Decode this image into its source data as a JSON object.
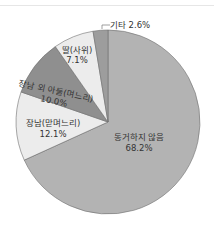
{
  "chart_data": {
    "type": "pie",
    "title": "",
    "start_angle": "12 o'clock",
    "direction": "clockwise",
    "slices": [
      {
        "label": "동거하지 않음",
        "value": 68.2,
        "color": "#b3b3b3"
      },
      {
        "label": "장남(맏며느리)",
        "value": 12.1,
        "color": "#ececec"
      },
      {
        "label": "장남 외 아들(며느리)",
        "value": 10.0,
        "color": "#8f8f8f"
      },
      {
        "label": "딸(사위)",
        "value": 7.1,
        "color": "#ececec"
      },
      {
        "label": "기타",
        "value": 2.6,
        "color": "#9d9d9d"
      }
    ]
  },
  "labels": {
    "s0_name": "동거하지 않음",
    "s0_pct": "68.2%",
    "s1_name": "장남(맏며느리)",
    "s1_pct": "12.1%",
    "s2_name": "장남 외 아들(며느리)",
    "s2_pct": "10.0%",
    "s3_name": "딸(사위)",
    "s3_pct": "7.1%",
    "s4_text": "기타 2.6%"
  }
}
